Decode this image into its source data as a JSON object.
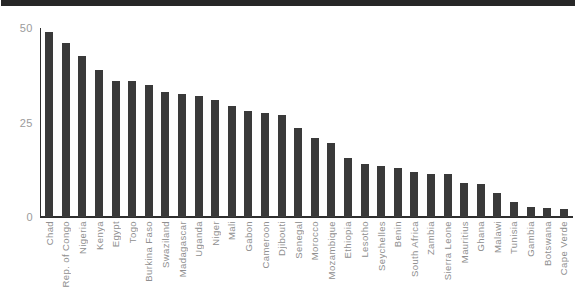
{
  "figure": {
    "background": "#ffffff",
    "top_rule_color": "#272727"
  },
  "chart_data": {
    "type": "bar",
    "title": "",
    "xlabel": "",
    "ylabel": "",
    "ylim": [
      0,
      50
    ],
    "yticks": [
      0,
      25,
      50
    ],
    "grid": false,
    "legend": "none",
    "bar_color": "#3a3a3a",
    "axis_color": "#2f2f2f",
    "ytick_label_color": "#9b9b9b",
    "xtick_label_color": "#8f8f8f",
    "categories": [
      "Chad",
      "Rep. of Congo",
      "Nigeria",
      "Kenya",
      "Egypt",
      "Togo",
      "Burkina Faso",
      "Swaziland",
      "Madagascar",
      "Uganda",
      "Niger",
      "Mali",
      "Gabon",
      "Cameroon",
      "Djibouti",
      "Senegal",
      "Morocco",
      "Mozambique",
      "Ethiopia",
      "Lesotho",
      "Seychelles",
      "Benin",
      "South Africa",
      "Zambia",
      "Sierra Leone",
      "Mauritius",
      "Ghana",
      "Malawi",
      "Tunisia",
      "Gambia",
      "Botswana",
      "Cape Verde"
    ],
    "values": [
      49,
      46,
      42.5,
      39,
      36,
      36,
      35,
      33,
      32.5,
      32,
      31,
      29.5,
      28,
      27.5,
      27,
      23.5,
      21,
      19.5,
      15.5,
      14,
      13.5,
      13,
      12,
      11.5,
      11.3,
      9,
      8.7,
      6.3,
      4,
      2.7,
      2.5,
      2.2
    ]
  }
}
